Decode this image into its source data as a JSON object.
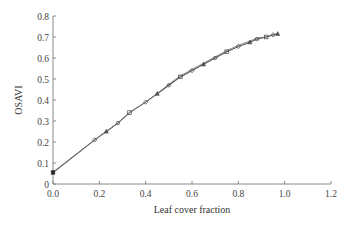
{
  "chart_data": {
    "type": "line",
    "title": "",
    "xlabel": "Leaf cover fraction",
    "ylabel": "OSAVI",
    "xlim": [
      0.0,
      1.2
    ],
    "ylim": [
      0,
      0.8
    ],
    "xticks": [
      "0.0",
      "0.2",
      "0.4",
      "0.6",
      "0.8",
      "1.0",
      "1.2"
    ],
    "yticks": [
      "0",
      "0.1",
      "0.2",
      "0.3",
      "0.4",
      "0.5",
      "0.6",
      "0.7",
      "0.8"
    ],
    "grid": false,
    "legend": null,
    "series": [
      {
        "name": "OSAVI vs leaf cover",
        "marker": "mixed (square, diamond, triangle, circle)",
        "color": "#555555",
        "x": [
          0.0,
          0.18,
          0.23,
          0.28,
          0.33,
          0.4,
          0.45,
          0.5,
          0.55,
          0.6,
          0.65,
          0.7,
          0.75,
          0.8,
          0.85,
          0.88,
          0.92,
          0.95,
          0.97
        ],
        "y": [
          0.055,
          0.21,
          0.25,
          0.29,
          0.34,
          0.39,
          0.43,
          0.47,
          0.51,
          0.54,
          0.57,
          0.6,
          0.63,
          0.655,
          0.675,
          0.69,
          0.7,
          0.71,
          0.715
        ]
      }
    ]
  }
}
